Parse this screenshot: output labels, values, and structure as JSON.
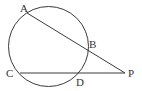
{
  "diagram": {
    "type": "circle-secants",
    "stroke_color": "#3a3a3a",
    "circle": {
      "cx": 48.5,
      "cy": 46.5,
      "r": 40
    },
    "points": {
      "A": {
        "x": 27,
        "y": 13,
        "label": "A",
        "lx": 20,
        "ly": 12
      },
      "B": {
        "x": 87,
        "y": 49,
        "label": "B",
        "lx": 89,
        "ly": 48
      },
      "C": {
        "x": 20,
        "y": 73,
        "label": "C",
        "lx": 6,
        "ly": 77
      },
      "D": {
        "x": 78,
        "y": 73,
        "label": "D",
        "lx": 76,
        "ly": 86
      },
      "P": {
        "x": 125,
        "y": 73,
        "label": "P",
        "lx": 128,
        "ly": 77
      }
    },
    "segments": [
      {
        "from": "A",
        "to": "P"
      },
      {
        "from": "C",
        "to": "P"
      }
    ]
  }
}
